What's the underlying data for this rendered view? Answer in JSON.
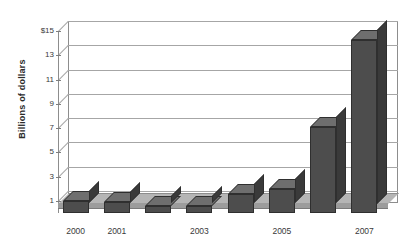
{
  "chart_data": {
    "type": "bar",
    "title": "",
    "subtitle": "",
    "xlabel": "",
    "ylabel": "Billions of dollars",
    "categories": [
      "2000",
      "2001",
      "2002",
      "2003",
      "2004",
      "2005",
      "2006",
      "2007"
    ],
    "values": [
      0.95,
      0.9,
      0.6,
      0.55,
      1.6,
      2.0,
      7.1,
      14.3
    ],
    "series": [
      {
        "name": "Billions of dollars",
        "values": [
          0.95,
          0.9,
          0.6,
          0.55,
          1.6,
          2.0,
          7.1,
          14.3
        ]
      }
    ],
    "ylim": [
      0,
      15
    ],
    "ytick_values": [
      1,
      3,
      5,
      7,
      9,
      11,
      13,
      15
    ],
    "ytick_labels": [
      "1",
      "3",
      "5",
      "7",
      "9",
      "11",
      "13",
      "$15"
    ],
    "xtick_labels_shown": [
      "2000",
      "2001",
      "2003",
      "2005",
      "2007"
    ],
    "grid": true,
    "legend": false,
    "style": "3d-column",
    "colors": {
      "bar_front": "#4d4d4d",
      "bar_top": "#6e6e6e",
      "bar_side": "#3a3a3a",
      "gridline": "#a6a6a6",
      "frame": "#8d8d8d",
      "floor": "#b5b5b5",
      "text": "#3a3a3a",
      "background": "#ffffff"
    }
  },
  "axis": {
    "y_title": "Billions of dollars",
    "y_ticks": [
      {
        "label": "$15",
        "value": 15
      },
      {
        "label": "13",
        "value": 13
      },
      {
        "label": "11",
        "value": 11
      },
      {
        "label": "9",
        "value": 9
      },
      {
        "label": "7",
        "value": 7
      },
      {
        "label": "5",
        "value": 5
      },
      {
        "label": "3",
        "value": 3
      },
      {
        "label": "1",
        "value": 1
      }
    ],
    "x_ticks": [
      {
        "label": "2000",
        "index": 0
      },
      {
        "label": "2001",
        "index": 1
      },
      {
        "label": "2003",
        "index": 3
      },
      {
        "label": "2005",
        "index": 5
      },
      {
        "label": "2007",
        "index": 7
      }
    ]
  }
}
